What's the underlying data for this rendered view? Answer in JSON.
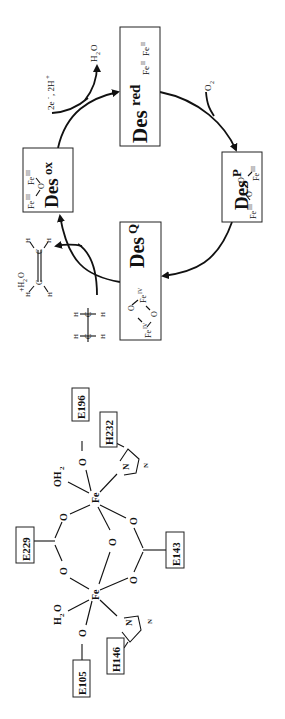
{
  "figure": {
    "orientation": "rotated 90 degrees counter-clockwise",
    "cycle": {
      "states": [
        {
          "id": "desred",
          "label": "Des",
          "sup": "red",
          "iron": "Fe",
          "iron_ox1": "II",
          "iron_ox2": "II"
        },
        {
          "id": "desp",
          "label": "Des",
          "sup": "P",
          "iron_left": "Fe",
          "iron_left_ox": "III",
          "bridge1": "O",
          "bridge2": "O",
          "iron_right": "Fe",
          "iron_right_ox": "III"
        },
        {
          "id": "desq",
          "label": "Des",
          "sup": "Q",
          "iron_left": "Fe",
          "iron_left_ox": "IV",
          "bridge1": "O",
          "bridge2": "O",
          "iron_right": "Fe",
          "iron_right_ox": "IV"
        },
        {
          "id": "desox",
          "label": "Des",
          "sup": "ox",
          "iron_left": "Fe",
          "iron_left_ox": "III",
          "bridge": "O",
          "iron_right": "Fe",
          "iron_right_ox": "III"
        }
      ],
      "inputs": {
        "o2": "O",
        "o2_sub": "2",
        "electrons": "2e",
        "electrons_sup": "-",
        "protons": ", 2H",
        "protons_sup": "+",
        "water_out": "H",
        "water_sub": "2",
        "water_o": "O",
        "substrate_h": "H",
        "substrate_c": "C",
        "product_plus_water": "+H",
        "product_water_sub": "2",
        "product_water_o": "O",
        "product_h": "H",
        "product_c": "C"
      }
    },
    "active_site": {
      "metal": "Fe",
      "bridge_o": "O",
      "carboxylate_o": "O",
      "residues": [
        "E196",
        "H232",
        "E229",
        "E143",
        "E105",
        "H146"
      ],
      "water_top": "OH",
      "water_top_sub": "2",
      "water_bottom_h": "H",
      "water_bottom_sub": "2",
      "water_bottom_o": "O",
      "imidazole_n": "N"
    }
  }
}
